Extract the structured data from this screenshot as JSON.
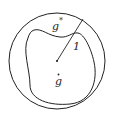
{
  "diagram": {
    "labels": {
      "outer_region": "g",
      "outer_superscript": "*",
      "inner_region": "g",
      "inner_accent": "˙",
      "radius": "1"
    },
    "stroke_color": "#222222",
    "background_color": "#ffffff"
  }
}
